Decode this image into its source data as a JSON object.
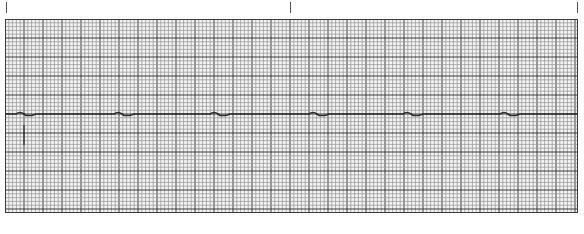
{
  "strip": {
    "type": "ecg-rhythm-strip",
    "grid": {
      "small_box_px": 3.8,
      "large_box_px": 19,
      "minor_color": "#9a9a9a",
      "major_color": "#3a3a3a",
      "background": "#f4f4f4"
    },
    "time_markers_x": [
      6,
      290,
      577
    ],
    "trace": {
      "color": "#2a2a2a",
      "baseline_y": 95,
      "complex_x": [
        15,
        113,
        209,
        308,
        402,
        499
      ]
    },
    "calibration_marker": {
      "x": 19,
      "y1": 106,
      "y2": 126
    }
  }
}
